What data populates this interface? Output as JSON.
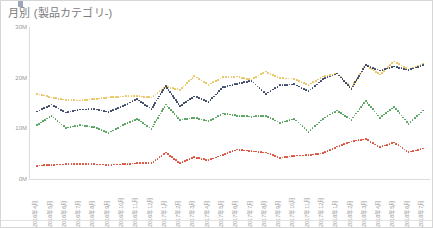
{
  "widget": {
    "title": "月別 (製品カテゴリ-)",
    "border_color": "#d6d6d6",
    "background": "#ffffff",
    "title_color": "#7b7b7b"
  },
  "chart_data": {
    "type": "line",
    "title": "月別 (製品カテゴリ-)",
    "xlabel": "",
    "ylabel": "",
    "ylim": [
      0,
      30000000
    ],
    "ytick_labels": [
      "0M",
      "10M",
      "20M",
      "30M"
    ],
    "ytick_values": [
      0,
      10000000,
      20000000,
      30000000
    ],
    "grid": false,
    "legend": "none",
    "line_style": "dotted",
    "categories": [
      "2016年4月",
      "2016年5月",
      "2016年6月",
      "2016年7月",
      "2016年8月",
      "2016年9月",
      "2016年10月",
      "2016年11月",
      "2016年12月",
      "2017年1月",
      "2017年2月",
      "2017年3月",
      "2017年4月",
      "2017年5月",
      "2017年6月",
      "2017年7月",
      "2017年8月",
      "2017年9月",
      "2017年10月",
      "2017年11月",
      "2017年12月",
      "2018年1月",
      "2018年2月",
      "2018年3月",
      "2018年4月",
      "2018年5月",
      "2018年6月",
      "2018年7月"
    ],
    "series": [
      {
        "name": "series-yellow",
        "color": "#e8c25a",
        "values": [
          16800000,
          16100000,
          15600000,
          15500000,
          15800000,
          16100000,
          16300000,
          16400000,
          16100000,
          18200000,
          17600000,
          20300000,
          18600000,
          20100000,
          20200000,
          19600000,
          21200000,
          19900000,
          19800000,
          18600000,
          20200000,
          20800000,
          18000000,
          22500000,
          20600000,
          23200000,
          21600000,
          22800000
        ]
      },
      {
        "name": "series-navy",
        "color": "#2e3b5e",
        "values": [
          13300000,
          14700000,
          13100000,
          13700000,
          13800000,
          13200000,
          14400000,
          15800000,
          13800000,
          18400000,
          14400000,
          16300000,
          15200000,
          18100000,
          18800000,
          19400000,
          16800000,
          18500000,
          18700000,
          17300000,
          19700000,
          20800000,
          17800000,
          22500000,
          21400000,
          22200000,
          21500000,
          22500000
        ]
      },
      {
        "name": "series-green",
        "color": "#4a9b52",
        "values": [
          10600000,
          12500000,
          10100000,
          10600000,
          10200000,
          9100000,
          10600000,
          11900000,
          9900000,
          14700000,
          11700000,
          12100000,
          11400000,
          12900000,
          12500000,
          12300000,
          12500000,
          11100000,
          11900000,
          9300000,
          11900000,
          13500000,
          11700000,
          15400000,
          12100000,
          14200000,
          10900000,
          13500000
        ]
      },
      {
        "name": "series-red",
        "color": "#d9452e",
        "values": [
          2600000,
          2800000,
          2900000,
          2900000,
          2900000,
          2800000,
          2900000,
          3100000,
          3100000,
          5200000,
          3100000,
          4300000,
          3700000,
          4800000,
          5800000,
          5500000,
          5200000,
          4200000,
          4600000,
          4700000,
          5100000,
          6400000,
          7400000,
          7900000,
          6300000,
          7200000,
          5300000,
          6000000
        ]
      }
    ]
  }
}
